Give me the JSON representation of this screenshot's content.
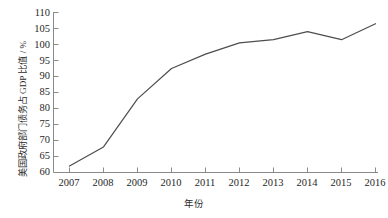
{
  "chart_data": {
    "type": "line",
    "title": "",
    "subtitle": "",
    "xlabel": "年份",
    "ylabel": "美国政府部门债务占 GDP 比值 / %",
    "categories": [
      "2007",
      "2008",
      "2009",
      "2010",
      "2011",
      "2012",
      "2013",
      "2014",
      "2015",
      "2016"
    ],
    "x": [
      2007,
      2008,
      2009,
      2010,
      2011,
      2012,
      2013,
      2014,
      2015,
      2016
    ],
    "values": [
      62,
      68,
      83,
      92.5,
      97,
      100.5,
      101.5,
      104,
      101.5,
      106.5
    ],
    "series": [
      {
        "name": "美国政府部门债务占 GDP 比值",
        "values": [
          62,
          68,
          83,
          92.5,
          97,
          100.5,
          101.5,
          104,
          101.5,
          106.5
        ]
      }
    ],
    "ylim": [
      60,
      110
    ],
    "xlim": [
      2007,
      2016
    ],
    "yticks": [
      60,
      65,
      70,
      75,
      80,
      85,
      90,
      95,
      100,
      105,
      110
    ],
    "ytick_labels": [
      "60",
      "65",
      "70",
      "75",
      "80",
      "85",
      "90",
      "95",
      "100",
      "105",
      "110"
    ],
    "xticks": [
      2007,
      2008,
      2009,
      2010,
      2011,
      2012,
      2013,
      2014,
      2015,
      2016
    ],
    "xtick_labels": [
      "2007",
      "2008",
      "2009",
      "2010",
      "2011",
      "2012",
      "2013",
      "2014",
      "2015",
      "2016"
    ],
    "grid": false,
    "legend": false,
    "legend_position": "none",
    "line_color": "#4d4d4d",
    "axis_color": "#808080",
    "background_color": "#ffffff",
    "annotations": []
  }
}
